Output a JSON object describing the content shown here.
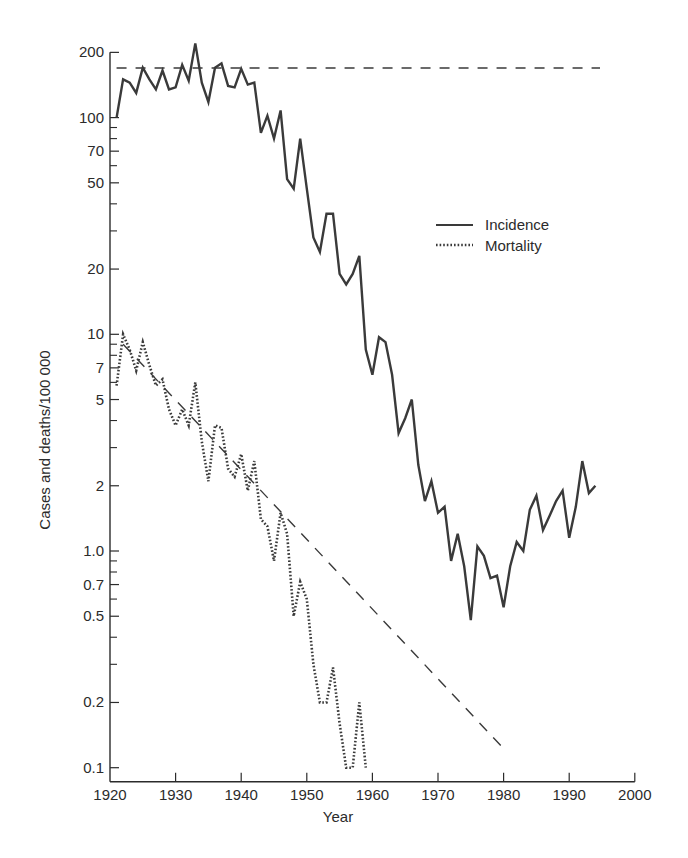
{
  "chart_data": {
    "type": "line",
    "title": "",
    "xlabel": "Year",
    "ylabel": "Cases and deaths/100 000",
    "yscale": "log",
    "xlim": [
      1920,
      2000
    ],
    "ylim": [
      0.1,
      200
    ],
    "x_ticks": [
      1920,
      1930,
      1940,
      1950,
      1960,
      1970,
      1980,
      1990,
      2000
    ],
    "y_tick_labels": [
      "200",
      "100",
      "70",
      "50",
      "20",
      "10",
      "7",
      "5",
      "2",
      "1.0",
      "0.7",
      "0.5",
      "0.2",
      "0.1"
    ],
    "y_tick_values": [
      200,
      100,
      70,
      50,
      20,
      10,
      7,
      5,
      2,
      1.0,
      0.7,
      0.5,
      0.2,
      0.1
    ],
    "y_minor_ticks": [
      90,
      80,
      60,
      40,
      30,
      9,
      8,
      6,
      4,
      3,
      0.9,
      0.8,
      0.6,
      0.4,
      0.3
    ],
    "grid": false,
    "legend": {
      "position": "upper right (inside)",
      "entries": [
        "Incidence",
        "Mortality"
      ]
    },
    "series": [
      {
        "name": "Incidence",
        "style": "solid",
        "x": [
          1921,
          1922,
          1923,
          1924,
          1925,
          1926,
          1927,
          1928,
          1929,
          1930,
          1931,
          1932,
          1933,
          1934,
          1935,
          1936,
          1937,
          1938,
          1939,
          1940,
          1941,
          1942,
          1943,
          1944,
          1945,
          1946,
          1947,
          1948,
          1949,
          1950,
          1951,
          1952,
          1953,
          1954,
          1955,
          1956,
          1957,
          1958,
          1959,
          1960,
          1961,
          1962,
          1963,
          1964,
          1965,
          1966,
          1967,
          1968,
          1969,
          1970,
          1971,
          1972,
          1973,
          1974,
          1975,
          1976,
          1977,
          1978,
          1979,
          1980,
          1981,
          1982,
          1983,
          1984,
          1985,
          1986,
          1987,
          1988,
          1989,
          1990,
          1991,
          1992,
          1993,
          1994
        ],
        "values": [
          100,
          150,
          145,
          130,
          170,
          150,
          135,
          165,
          135,
          138,
          175,
          148,
          220,
          145,
          118,
          170,
          178,
          140,
          138,
          168,
          142,
          145,
          85,
          102,
          80,
          108,
          52,
          47,
          80,
          47,
          28,
          24,
          36,
          36,
          19,
          17,
          19,
          23,
          8.5,
          6.5,
          9.7,
          9.2,
          6.5,
          3.5,
          4.1,
          5.0,
          2.5,
          1.7,
          2.1,
          1.5,
          1.6,
          0.9,
          1.2,
          0.85,
          0.48,
          1.05,
          0.95,
          0.75,
          0.77,
          0.55,
          0.85,
          1.1,
          1.0,
          1.55,
          1.8,
          1.25,
          1.45,
          1.7,
          1.9,
          1.15,
          1.6,
          2.6,
          1.85,
          2.0
        ]
      },
      {
        "name": "Mortality",
        "style": "dotted",
        "x": [
          1921,
          1922,
          1923,
          1924,
          1925,
          1926,
          1927,
          1928,
          1929,
          1930,
          1931,
          1932,
          1933,
          1934,
          1935,
          1936,
          1937,
          1938,
          1939,
          1940,
          1941,
          1942,
          1943,
          1944,
          1945,
          1946,
          1947,
          1948,
          1949,
          1950,
          1951,
          1952,
          1953,
          1954,
          1955,
          1956,
          1957,
          1958,
          1959
        ],
        "values": [
          5.8,
          10,
          8.5,
          6.8,
          9.2,
          7.2,
          5.8,
          6.2,
          4.5,
          3.8,
          4.5,
          3.8,
          6.0,
          3.2,
          2.1,
          3.8,
          3.7,
          2.4,
          2.2,
          2.8,
          1.9,
          2.6,
          1.4,
          1.3,
          0.9,
          1.5,
          1.2,
          0.5,
          0.72,
          0.6,
          0.3,
          0.2,
          0.2,
          0.29,
          0.16,
          0.1,
          0.1,
          0.2,
          0.1
        ]
      }
    ],
    "reference_lines": [
      {
        "name": "Incidence baseline (horizontal dashed)",
        "x": [
          1921,
          1994
        ],
        "values": [
          165,
          165
        ]
      },
      {
        "name": "Mortality trend (diagonal dashed)",
        "x": [
          1922,
          1981
        ],
        "values": [
          9.0,
          0.12
        ]
      }
    ]
  },
  "labels": {
    "xlabel": "Year",
    "ylabel": "Cases and deaths/100 000",
    "legend_incidence": "Incidence",
    "legend_mortality": "Mortality"
  },
  "colors": {
    "line": "#3a3a3a",
    "axis": "#2b2b2b",
    "background": "#ffffff"
  }
}
